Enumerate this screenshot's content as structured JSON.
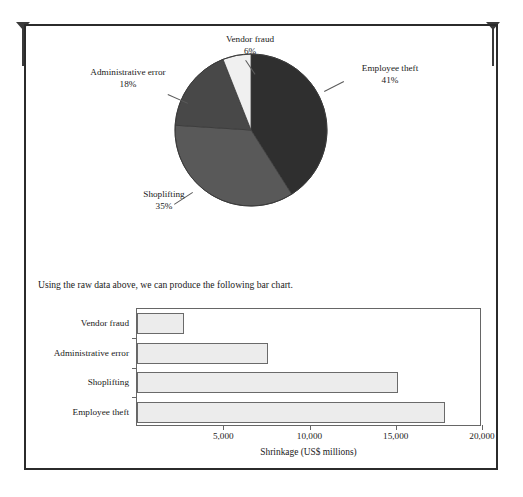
{
  "page": {
    "caption": "Using the raw data above, we can produce the following bar chart.",
    "crop_mark_left": "crop-mark",
    "crop_mark_right": "crop-mark"
  },
  "chart_data": [
    {
      "type": "pie",
      "title": "",
      "categories": [
        "Employee theft",
        "Shoplifting",
        "Administrative error",
        "Vendor fraud"
      ],
      "values": [
        41,
        35,
        18,
        6
      ],
      "value_suffix": "%",
      "labels": [
        {
          "name": "Employee theft",
          "pct": "41%",
          "color": "#2f2f2f"
        },
        {
          "name": "Shoplifting",
          "pct": "35%",
          "color": "#595959"
        },
        {
          "name": "Administrative error",
          "pct": "18%",
          "color": "#484848"
        },
        {
          "name": "Vendor fraud",
          "pct": "6%",
          "color": "#f0f0f0"
        }
      ],
      "legend": "labels-outside-with-leader-lines",
      "start_angle_deg": 0
    },
    {
      "type": "bar",
      "orientation": "horizontal",
      "title": "",
      "categories": [
        "Vendor fraud",
        "Administrative error",
        "Shoplifting",
        "Employee theft"
      ],
      "values": [
        2700,
        7600,
        15100,
        17850
      ],
      "xlabel": "Shrinkage (US$ millions)",
      "ylabel": "",
      "xlim": [
        0,
        20000
      ],
      "xticks": [
        5000,
        10000,
        15000,
        20000
      ],
      "xticklabels": [
        "5,000",
        "10,000",
        "15,000",
        "20,000"
      ],
      "grid": false,
      "bar_fill": "#ececec",
      "bar_stroke": "#6a6a6a"
    }
  ]
}
